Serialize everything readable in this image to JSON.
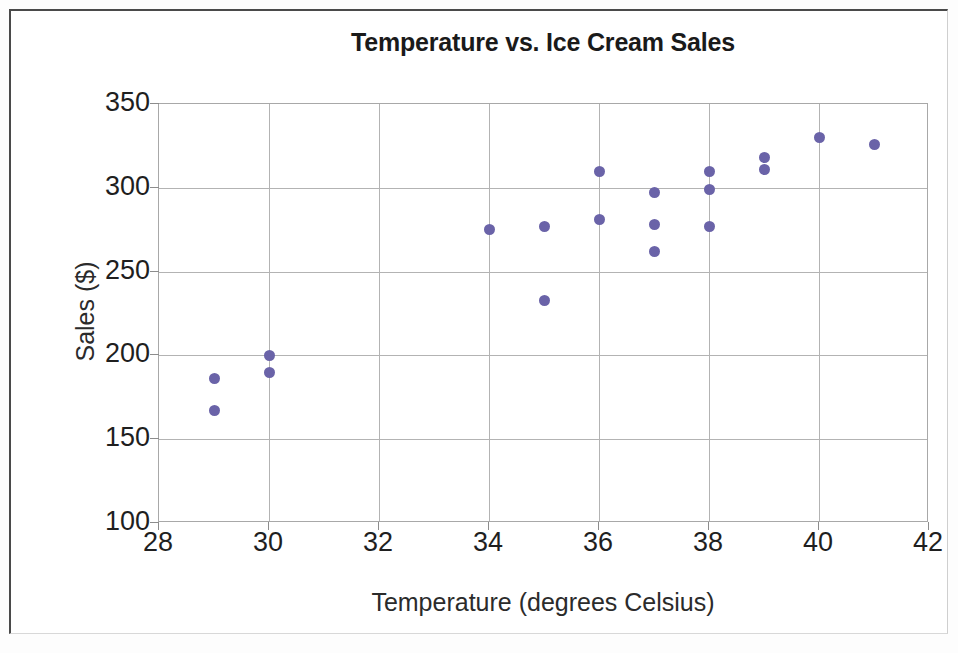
{
  "chart_data": {
    "type": "scatter",
    "title": "Temperature vs. Ice Cream Sales",
    "xlabel": "Temperature (degrees Celsius)",
    "ylabel": "Sales ($)",
    "xlim": [
      28,
      42
    ],
    "ylim": [
      100,
      350
    ],
    "xticks": [
      28,
      30,
      32,
      34,
      36,
      38,
      40,
      42
    ],
    "yticks": [
      100,
      150,
      200,
      250,
      300,
      350
    ],
    "grid": true,
    "legend": false,
    "marker_color": "#6a63a8",
    "points": [
      {
        "x": 29,
        "y": 186
      },
      {
        "x": 29,
        "y": 167
      },
      {
        "x": 30,
        "y": 200
      },
      {
        "x": 30,
        "y": 190
      },
      {
        "x": 34,
        "y": 275
      },
      {
        "x": 35,
        "y": 277
      },
      {
        "x": 35,
        "y": 233
      },
      {
        "x": 36,
        "y": 310
      },
      {
        "x": 36,
        "y": 281
      },
      {
        "x": 37,
        "y": 297
      },
      {
        "x": 37,
        "y": 278
      },
      {
        "x": 37,
        "y": 262
      },
      {
        "x": 38,
        "y": 310
      },
      {
        "x": 38,
        "y": 299
      },
      {
        "x": 38,
        "y": 277
      },
      {
        "x": 39,
        "y": 318
      },
      {
        "x": 39,
        "y": 311
      },
      {
        "x": 40,
        "y": 330
      },
      {
        "x": 41,
        "y": 326
      }
    ]
  }
}
